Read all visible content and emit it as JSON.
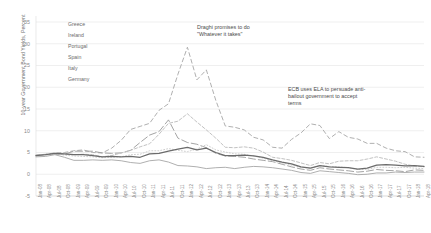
{
  "chart_data": {
    "type": "line",
    "title": "",
    "xlabel": "",
    "ylabel": "10-year Government Bond Yields, Percent",
    "ylim": [
      -5,
      35
    ],
    "yticks": [
      -5,
      0,
      5,
      10,
      15,
      20,
      25,
      30,
      35
    ],
    "grid": true,
    "legend_position": "top-left",
    "x": [
      "Jan-08",
      "Apr-08",
      "Jul-08",
      "Oct-08",
      "Jan-09",
      "Apr-09",
      "Jul-09",
      "Oct-09",
      "Jan-10",
      "Apr-10",
      "Jul-10",
      "Oct-10",
      "Jan-11",
      "Apr-11",
      "Jul-11",
      "Oct-11",
      "Jan-12",
      "Apr-12",
      "Jul-12",
      "Oct-12",
      "Jan-13",
      "Apr-13",
      "Jul-13",
      "Oct-13",
      "Jan-14",
      "Apr-14",
      "Jul-14",
      "Oct-14",
      "Jan-15",
      "Apr-15",
      "Jul-15",
      "Oct-15",
      "Jan-16",
      "Apr-16",
      "Jul-16",
      "Oct-16",
      "Jan-17",
      "Apr-17",
      "Jul-17",
      "Oct-17",
      "Jan-18",
      "Apr-18"
    ],
    "series": [
      {
        "name": "Greece",
        "color": "#b0b0b0",
        "dash": "4,3",
        "width": 1.0,
        "values": [
          4.4,
          4.6,
          4.9,
          5.0,
          5.4,
          5.6,
          5.0,
          4.9,
          6.0,
          7.8,
          10.3,
          11.0,
          11.7,
          14.7,
          16.2,
          23.0,
          29.2,
          21.7,
          24.0,
          17.0,
          11.1,
          10.8,
          10.2,
          8.5,
          7.9,
          6.2,
          6.0,
          8.0,
          9.5,
          11.6,
          11.2,
          8.2,
          9.8,
          8.5,
          8.1,
          7.1,
          7.1,
          6.0,
          5.4,
          5.2,
          4.0,
          3.9
        ]
      },
      {
        "name": "Ireland",
        "color": "#9a9a9a",
        "dash": "7,3",
        "width": 0.9,
        "values": [
          4.3,
          4.5,
          4.6,
          4.6,
          5.3,
          5.3,
          5.3,
          4.9,
          4.8,
          4.9,
          5.5,
          7.3,
          9.0,
          9.8,
          12.5,
          8.3,
          7.3,
          6.9,
          6.1,
          4.8,
          4.2,
          4.1,
          3.9,
          3.5,
          3.2,
          2.9,
          2.3,
          1.7,
          1.2,
          0.9,
          1.5,
          1.2,
          1.0,
          0.8,
          0.5,
          0.7,
          1.1,
          0.9,
          0.8,
          0.6,
          1.0,
          0.9
        ]
      },
      {
        "name": "Portugal",
        "color": "#c2c2c2",
        "dash": "3,2",
        "width": 1.0,
        "values": [
          4.4,
          4.5,
          4.8,
          4.6,
          4.5,
          4.6,
          4.5,
          4.0,
          4.3,
          4.9,
          5.5,
          6.3,
          7.0,
          9.2,
          11.7,
          12.2,
          13.9,
          12.0,
          10.2,
          8.3,
          6.2,
          6.1,
          6.3,
          6.0,
          5.1,
          3.9,
          3.6,
          3.2,
          2.6,
          2.0,
          2.7,
          2.4,
          3.0,
          3.1,
          3.1,
          3.5,
          4.0,
          3.5,
          3.0,
          2.3,
          1.9,
          1.7
        ]
      },
      {
        "name": "Spain",
        "color": "#cfcfcf",
        "dash": "1,2",
        "width": 1.0,
        "values": [
          4.2,
          4.4,
          4.7,
          4.4,
          4.2,
          4.1,
          4.0,
          3.8,
          3.9,
          4.0,
          4.5,
          4.6,
          5.4,
          5.4,
          5.9,
          5.5,
          5.2,
          5.8,
          6.8,
          5.6,
          5.1,
          4.7,
          4.6,
          4.2,
          3.7,
          3.1,
          2.6,
          2.1,
          1.6,
          1.4,
          2.0,
          1.8,
          1.7,
          1.5,
          1.1,
          1.1,
          1.6,
          1.6,
          1.5,
          1.6,
          1.4,
          1.3
        ]
      },
      {
        "name": "Italy",
        "color": "#6b6b6b",
        "dash": "0",
        "width": 1.25,
        "values": [
          4.3,
          4.5,
          4.8,
          4.7,
          4.5,
          4.5,
          4.3,
          4.0,
          4.1,
          4.0,
          4.1,
          3.9,
          4.7,
          4.8,
          5.3,
          5.8,
          6.2,
          5.6,
          6.0,
          5.0,
          4.3,
          4.3,
          4.4,
          4.2,
          3.9,
          3.3,
          2.8,
          2.4,
          1.7,
          1.4,
          2.0,
          1.7,
          1.6,
          1.5,
          1.2,
          1.4,
          2.1,
          2.2,
          2.1,
          1.9,
          2.0,
          1.8
        ]
      },
      {
        "name": "Germany",
        "color": "#a6a6a6",
        "dash": "0",
        "width": 0.9,
        "values": [
          4.0,
          4.1,
          4.5,
          3.9,
          3.2,
          3.2,
          3.3,
          3.2,
          3.3,
          3.1,
          2.7,
          2.5,
          3.1,
          3.3,
          2.8,
          2.0,
          1.9,
          1.7,
          1.3,
          1.5,
          1.6,
          1.3,
          1.6,
          1.8,
          1.7,
          1.5,
          1.2,
          0.9,
          0.4,
          0.2,
          0.8,
          0.6,
          0.4,
          0.2,
          -0.1,
          0.0,
          0.3,
          0.3,
          0.5,
          0.4,
          0.5,
          0.5
        ]
      }
    ]
  },
  "axis": {
    "y_title": "10-year Government Bond Yields, Percent",
    "y_ticks": [
      "35",
      "30",
      "25",
      "20",
      "15",
      "10",
      "5",
      "0",
      "-5"
    ]
  },
  "legend": {
    "items": [
      {
        "label": "Greece"
      },
      {
        "label": "Ireland"
      },
      {
        "label": "Portugal"
      },
      {
        "label": "Spain"
      },
      {
        "label": "Italy"
      },
      {
        "label": "Germany"
      }
    ]
  },
  "annotations": {
    "draghi": "Draghi promises to do \"Whatever it takes\"",
    "ela": "ECB uses ELA to persuade anti-bailout government to accept terms"
  }
}
